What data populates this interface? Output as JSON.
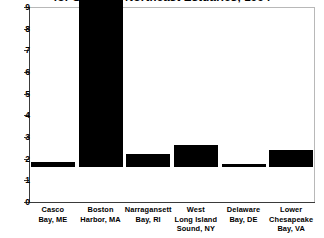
{
  "chart_data": {
    "type": "bar",
    "title": "for Selected Northeast Estuaries, 1994",
    "xlabel": "",
    "ylabel": "",
    "ylim": [
      0,
      9
    ],
    "grid": false,
    "legend": null,
    "bar_color": "#000000",
    "axis_color": "#3a3a3a",
    "frame_color": "#b8b8b8",
    "note": "Boston Harbor bar extends beyond the top of the plot area (clipped)",
    "categories": [
      "Casco Bay, ME",
      "Boston Harbor, MA",
      "Narragansett Bay, RI",
      "West Long Island Sound, NY",
      "Delaware Bay, DE",
      "Lower Chesapeake Bay, VA"
    ],
    "category_lines": [
      [
        "Casco",
        "Bay, ME"
      ],
      [
        "Boston",
        "Harbor, MA"
      ],
      [
        "Narragansett",
        "Bay, RI"
      ],
      [
        "West",
        "Long Island",
        "Sound, NY"
      ],
      [
        "Delaware",
        "Bay, DE"
      ],
      [
        "Lower",
        "Chesapeake",
        "Bay, VA"
      ]
    ],
    "values": [
      0.25,
      9.3,
      0.6,
      1.0,
      0.15,
      0.8
    ],
    "ytick_values": [
      9,
      8,
      7,
      6,
      5,
      4,
      3,
      2,
      1,
      0
    ],
    "ytick_labels": [
      "9",
      "8",
      "7",
      "6",
      "5",
      "4",
      "3",
      "2",
      "1",
      "0"
    ]
  }
}
